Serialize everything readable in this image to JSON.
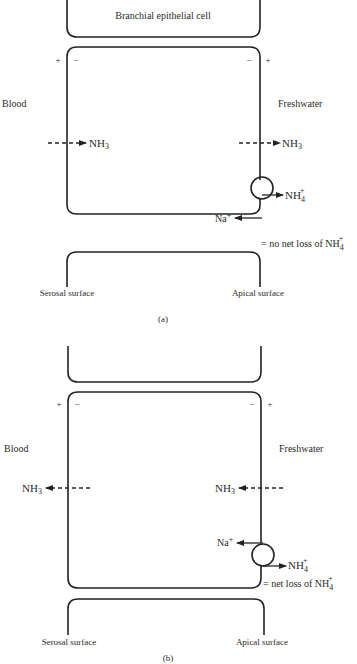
{
  "panel_a": {
    "top_cell_label": "Branchial epithelial cell",
    "left_plus": "+",
    "left_minus": "−",
    "right_minus": "−",
    "right_plus": "+",
    "left_side": "Blood",
    "right_side": "Freshwater",
    "nh3_basolateral": "NH",
    "nh3_basolateral_sub": "3",
    "nh3_apical": "NH",
    "nh3_apical_sub": "3",
    "nh4_out": "NH",
    "nh4_out_sub": "4",
    "nh4_out_sup": "+",
    "na_in": "Na",
    "na_in_sup": "+",
    "result": "= no net loss of NH",
    "result_sub": "4",
    "result_sup": "+",
    "serosal": "Serosal surface",
    "apical": "Apical surface",
    "caption": "(a)"
  },
  "panel_b": {
    "left_plus": "+",
    "left_minus": "−",
    "right_minus": "−",
    "right_plus": "+",
    "left_side": "Blood",
    "right_side": "Freshwater",
    "nh3_basolateral": "NH",
    "nh3_basolateral_sub": "3",
    "nh3_apical": "NH",
    "nh3_apical_sub": "3",
    "na_in": "Na",
    "na_in_sup": "+",
    "nh4_out": "NH",
    "nh4_out_sub": "4",
    "nh4_out_sup": "+",
    "result": "= net loss of NH",
    "result_sub": "4",
    "result_sup": "+",
    "serosal": "Serosal surface",
    "apical": "Apical surface",
    "caption": "(b)"
  }
}
